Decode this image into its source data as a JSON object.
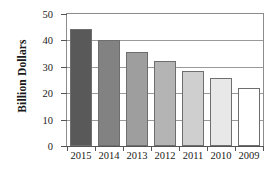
{
  "chart_data": {
    "type": "bar",
    "title": "",
    "xlabel": "",
    "ylabel": "Billion Dollars",
    "categories": [
      "2015",
      "2014",
      "2013",
      "2012",
      "2011",
      "2010",
      "2009"
    ],
    "values": [
      44.3,
      40.3,
      35.8,
      32.2,
      28.3,
      25.6,
      22.0
    ],
    "bar_colors": [
      "#595959",
      "#828282",
      "#9e9e9e",
      "#b4b4b4",
      "#cfcfcf",
      "#e8e8e8",
      "#ffffff"
    ],
    "bar_border_color": "#6e6e6e",
    "ylim": [
      0,
      50
    ],
    "yticks": [
      0,
      10,
      20,
      30,
      40,
      50
    ],
    "ytick_labels": [
      "0",
      "10",
      "20",
      "30",
      "40",
      "50"
    ],
    "grid": true,
    "grid_axis": "y",
    "grid_color": "#9a9a9a",
    "legend": false,
    "legend_position": "none",
    "frame": true,
    "background": "#ffffff"
  }
}
